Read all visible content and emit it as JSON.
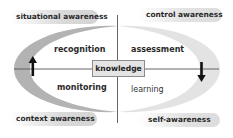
{
  "diagram": {
    "center": {
      "label": "knowledge"
    },
    "corner_labels": {
      "top_left": "situational awareness",
      "top_right": "control awareness",
      "bottom_left": "context awareness",
      "bottom_right": "self-awareness"
    },
    "quadrant_labels": {
      "top_left": "recognition",
      "top_right": "assessment",
      "bottom_left": "monitoring",
      "bottom_right": "learning"
    },
    "arrows": {
      "left": "up",
      "right": "down"
    },
    "colors": {
      "left_crescent": "#b3b3b3",
      "right_crescent": "#e3e3e3",
      "axis_lines": "#555555",
      "arrow": "#111111",
      "center_box_fill": "#e4e4e4",
      "center_box_border": "#8c8c8c"
    }
  }
}
